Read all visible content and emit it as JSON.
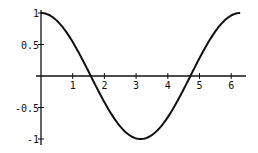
{
  "chart_data": {
    "type": "line",
    "title": "",
    "xlabel": "",
    "ylabel": "",
    "function": "cos(x)",
    "xlim": [
      0,
      6.2832
    ],
    "ylim": [
      -1,
      1
    ],
    "grid": false,
    "legend": null,
    "x_ticks": [
      1,
      2,
      3,
      4,
      5,
      6
    ],
    "x_tick_labels": [
      "1",
      "2",
      "3",
      "4",
      "5",
      "6"
    ],
    "y_ticks": [
      1,
      0.5,
      -0.5,
      -1
    ],
    "y_tick_labels": [
      "1",
      "0.5",
      "-0.5",
      "-1"
    ],
    "series": [
      {
        "name": "cos(x)",
        "color": "#111111",
        "x": [
          0,
          0.5,
          1,
          1.5,
          1.5708,
          2,
          2.5,
          3,
          3.1416,
          3.5,
          4,
          4.5,
          4.7124,
          5,
          5.5,
          6,
          6.2832
        ],
        "y": [
          1,
          0.878,
          0.54,
          0.071,
          0,
          -0.416,
          -0.801,
          -0.99,
          -1,
          -0.936,
          -0.654,
          -0.211,
          0,
          0.284,
          0.709,
          0.96,
          1
        ]
      }
    ]
  }
}
